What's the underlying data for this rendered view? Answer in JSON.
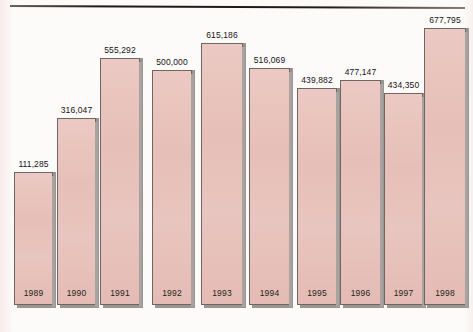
{
  "chart_data": {
    "type": "bar",
    "title": "",
    "subtitle": "",
    "xlabel": "",
    "ylabel": "",
    "grid": false,
    "legend": null,
    "ylim": [
      0,
      677795
    ],
    "categories": [
      "1989",
      "1990",
      "1991",
      "1992",
      "1993",
      "1994",
      "1995",
      "1996",
      "1997",
      "1998"
    ],
    "values": [
      111285,
      316047,
      555292,
      500000,
      615186,
      516069,
      439882,
      477147,
      434350,
      677795
    ],
    "value_labels": [
      "111,285",
      "316,047",
      "555,292",
      "500,000",
      "615,186",
      "516,069",
      "439,882",
      "477,147",
      "434,350",
      "677,795"
    ],
    "series": [
      {
        "name": "",
        "values": [
          111285,
          316047,
          555292,
          500000,
          615186,
          516069,
          439882,
          477147,
          434350,
          677795
        ]
      }
    ]
  },
  "style": {
    "bar_fill": "#e8c3bd",
    "bar_border": "#6f6664",
    "bar_shadow": "#a8a2a0",
    "background": "#fdfbfa",
    "text_color": "#161314",
    "rule_color": "#1c1614"
  },
  "bars": [
    {
      "year": "1989",
      "value_label": "111,285",
      "left": 14,
      "width": 39,
      "height": 133
    },
    {
      "year": "1990",
      "value_label": "316,047",
      "left": 57,
      "width": 39,
      "height": 187
    },
    {
      "year": "1991",
      "value_label": "555,292",
      "left": 100,
      "width": 40,
      "height": 247
    },
    {
      "year": "1992",
      "value_label": "500,000",
      "left": 152,
      "width": 40,
      "height": 235
    },
    {
      "year": "1993",
      "value_label": "615,186",
      "left": 201,
      "width": 42,
      "height": 262
    },
    {
      "year": "1994",
      "value_label": "516,069",
      "left": 249,
      "width": 41,
      "height": 237
    },
    {
      "year": "1995",
      "value_label": "439,882",
      "left": 297,
      "width": 40,
      "height": 217
    },
    {
      "year": "1996",
      "value_label": "477,147",
      "left": 340,
      "width": 41,
      "height": 225
    },
    {
      "year": "1997",
      "value_label": "434,350",
      "left": 384,
      "width": 39,
      "height": 212
    },
    {
      "year": "1998",
      "value_label": "677,795",
      "left": 424,
      "width": 42,
      "height": 277
    }
  ]
}
